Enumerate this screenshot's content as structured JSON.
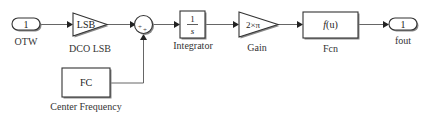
{
  "diagram": {
    "blocks": {
      "otw": {
        "type": "inport",
        "port_number": "1",
        "label": "OTW"
      },
      "dco_lsb": {
        "type": "gain",
        "value": "LSB",
        "label": "DCO LSB"
      },
      "sum": {
        "type": "sum",
        "signs": [
          "+",
          "+"
        ]
      },
      "center_frequency": {
        "type": "constant",
        "value": "FC",
        "label": "Center Frequency"
      },
      "integrator": {
        "type": "integrator",
        "numerator": "1",
        "denominator": "s",
        "label": "Integrator"
      },
      "gain": {
        "type": "gain",
        "value": "2×π",
        "label": "Gain"
      },
      "fcn": {
        "type": "fcn",
        "expression": "f(u)",
        "label": "Fcn"
      },
      "fout": {
        "type": "outport",
        "port_number": "1",
        "label": "fout"
      }
    },
    "connections": [
      {
        "from": "OTW",
        "to": "DCO LSB"
      },
      {
        "from": "DCO LSB",
        "to": "Sum"
      },
      {
        "from": "Center Frequency",
        "to": "Sum"
      },
      {
        "from": "Sum",
        "to": "Integrator"
      },
      {
        "from": "Integrator",
        "to": "Gain"
      },
      {
        "from": "Gain",
        "to": "Fcn"
      },
      {
        "from": "Fcn",
        "to": "fout"
      }
    ]
  }
}
